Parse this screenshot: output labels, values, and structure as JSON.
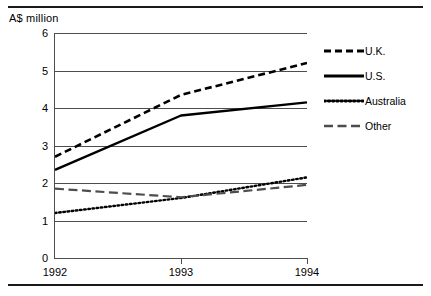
{
  "chart_data": {
    "type": "line",
    "title": "",
    "subtitle": "",
    "xlabel": "",
    "ylabel": "A$ million",
    "unit_label": "A$ million",
    "x": [
      "1992",
      "1993",
      "1994"
    ],
    "categories": [
      "1992",
      "1993",
      "1994"
    ],
    "xtick_labels": [
      "1992",
      "1993",
      "1994"
    ],
    "ytick_labels": [
      "6",
      "5",
      "4",
      "3",
      "2",
      "1",
      "0"
    ],
    "ylim": [
      0,
      6
    ],
    "ytick_values": [
      6,
      5,
      4,
      3,
      2,
      1,
      0
    ],
    "grid": "horizontal",
    "legend_position": "right",
    "series": [
      {
        "name": "U.K.",
        "label": "U.K.",
        "dash": "dashed",
        "values": [
          2.7,
          4.35,
          5.2
        ],
        "color": "#000000"
      },
      {
        "name": "U.S.",
        "label": "U.S.",
        "dash": "solid",
        "values": [
          2.35,
          3.8,
          4.15
        ],
        "color": "#000000"
      },
      {
        "name": "Australia",
        "label": "Australia",
        "dash": "dotted",
        "values": [
          1.2,
          1.6,
          2.15
        ],
        "color": "#000000"
      },
      {
        "name": "Other",
        "label": "Other",
        "dash": "long-dash",
        "values": [
          1.85,
          1.62,
          1.95
        ],
        "color": "#4d4d4d"
      }
    ]
  },
  "legend": {
    "items": [
      {
        "label": "U.K.",
        "swatch": "dashed-line-swatch"
      },
      {
        "label": "U.S.",
        "swatch": "solid-line-swatch"
      },
      {
        "label": "Australia",
        "swatch": "dotted-line-swatch"
      },
      {
        "label": "Other",
        "swatch": "long-dash-line-swatch"
      }
    ]
  },
  "axes": {
    "y": {
      "labels": [
        "6",
        "5",
        "4",
        "3",
        "2",
        "1",
        "0"
      ]
    },
    "x": {
      "labels": [
        "1992",
        "1993",
        "1994"
      ]
    }
  }
}
